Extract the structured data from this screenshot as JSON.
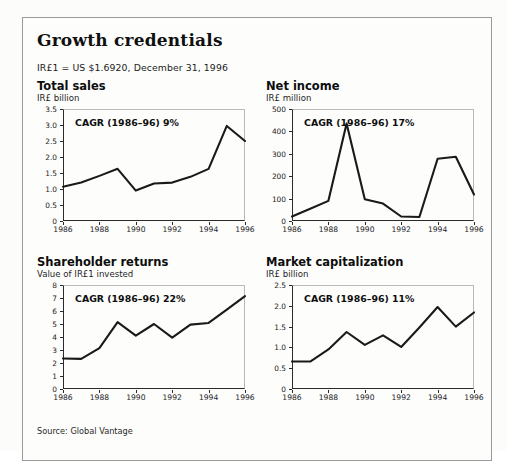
{
  "exhibit": {
    "title": "Growth credentials",
    "subtitle": "IR£1 = US $1.6920, December 31, 1996",
    "source": "Source: Global Vantage"
  },
  "charts": [
    {
      "id": "total-sales",
      "title": "Total sales",
      "unit": "IR£ billion",
      "cagr_label": "CAGR (1986–96) 9%",
      "chart_data": {
        "type": "line",
        "title": "Total sales",
        "xlabel": "",
        "ylabel": "IR£ billion",
        "x": [
          1986,
          1987,
          1988,
          1989,
          1990,
          1991,
          1992,
          1993,
          1994,
          1995,
          1996
        ],
        "values": [
          1.07,
          1.2,
          1.41,
          1.63,
          0.95,
          1.17,
          1.2,
          1.38,
          1.63,
          2.97,
          2.5
        ],
        "ylim": [
          0,
          3.5
        ],
        "yticks": [
          0,
          0.5,
          1.0,
          1.5,
          2.0,
          2.5,
          3.0,
          3.5
        ],
        "yticklabels": [
          "0",
          "0.5",
          "1.0",
          "1.5",
          "2.0",
          "2.5",
          "3.0",
          "3.5"
        ],
        "xticks": [
          1986,
          1988,
          1990,
          1992,
          1994,
          1996
        ],
        "xticklabels": [
          "1986",
          "1988",
          "1990",
          "1992",
          "1994",
          "1996"
        ],
        "grid": false,
        "legend": "none",
        "annotation": "CAGR (1986–96) 9%"
      }
    },
    {
      "id": "net-income",
      "title": "Net income",
      "unit": "IR£ million",
      "cagr_label": "CAGR (1986–96) 17%",
      "chart_data": {
        "type": "line",
        "title": "Net income",
        "xlabel": "",
        "ylabel": "IR£ million",
        "x": [
          1986,
          1987,
          1988,
          1989,
          1990,
          1991,
          1992,
          1993,
          1994,
          1995,
          1996
        ],
        "values": [
          20,
          55,
          90,
          435,
          97,
          78,
          20,
          18,
          278,
          287,
          118
        ],
        "ylim": [
          0,
          500
        ],
        "yticks": [
          0,
          100,
          200,
          300,
          400,
          500
        ],
        "yticklabels": [
          "0",
          "100",
          "200",
          "300",
          "400",
          "500"
        ],
        "xticks": [
          1986,
          1988,
          1990,
          1992,
          1994,
          1996
        ],
        "xticklabels": [
          "1986",
          "1988",
          "1990",
          "1992",
          "1994",
          "1996"
        ],
        "grid": false,
        "legend": "none",
        "annotation": "CAGR (1986–96) 17%"
      }
    },
    {
      "id": "shareholder-returns",
      "title": "Shareholder returns",
      "unit": "Value of IR£1 invested",
      "cagr_label": "CAGR (1986–96) 22%",
      "chart_data": {
        "type": "line",
        "title": "Shareholder returns",
        "xlabel": "",
        "ylabel": "Value of IR£1 invested",
        "x": [
          1986,
          1987,
          1988,
          1989,
          1990,
          1991,
          1992,
          1993,
          1994,
          1995,
          1996
        ],
        "values": [
          2.35,
          2.32,
          3.15,
          5.15,
          4.1,
          5.0,
          3.95,
          4.95,
          5.08,
          6.1,
          7.15
        ],
        "ylim": [
          0,
          8
        ],
        "yticks": [
          0,
          1,
          2,
          3,
          4,
          5,
          6,
          7,
          8
        ],
        "yticklabels": [
          "0",
          "1",
          "2",
          "3",
          "4",
          "5",
          "6",
          "7",
          "8"
        ],
        "xticks": [
          1986,
          1988,
          1990,
          1992,
          1994,
          1996
        ],
        "xticklabels": [
          "1986",
          "1988",
          "1990",
          "1992",
          "1994",
          "1996"
        ],
        "grid": false,
        "legend": "none",
        "annotation": "CAGR (1986–96) 22%"
      }
    },
    {
      "id": "market-capitalization",
      "title": "Market capitalization",
      "unit": "IR£ billion",
      "cagr_label": "CAGR (1986–96) 11%",
      "chart_data": {
        "type": "line",
        "title": "Market capitalization",
        "xlabel": "",
        "ylabel": "IR£ billion",
        "x": [
          1986,
          1987,
          1988,
          1989,
          1990,
          1991,
          1992,
          1993,
          1994,
          1995,
          1996
        ],
        "values": [
          0.66,
          0.66,
          0.95,
          1.37,
          1.06,
          1.29,
          1.01,
          1.48,
          1.97,
          1.5,
          1.84
        ],
        "ylim": [
          0,
          2.5
        ],
        "yticks": [
          0,
          0.5,
          1.0,
          1.5,
          2.0,
          2.5
        ],
        "yticklabels": [
          "0",
          "0.5",
          "1.0",
          "1.5",
          "2.0",
          "2.5"
        ],
        "xticks": [
          1986,
          1988,
          1990,
          1992,
          1994,
          1996
        ],
        "xticklabels": [
          "1986",
          "1988",
          "1990",
          "1992",
          "1994",
          "1996"
        ],
        "grid": false,
        "legend": "none",
        "annotation": "CAGR (1986–96) 11%"
      }
    }
  ],
  "style": {
    "line_color": "#1a1a1a",
    "axis_color": "#2b2b2b",
    "frame_color": "#9a9a9a",
    "background": "#fdfdfc"
  }
}
